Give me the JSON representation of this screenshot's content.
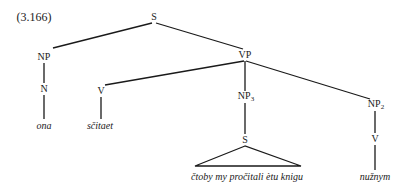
{
  "example_number": "(3.166)",
  "tree": {
    "root": {
      "label": "S",
      "x": 154,
      "y": 17
    },
    "nodes": {
      "np": {
        "label": "NP",
        "x": 44,
        "y": 57
      },
      "n": {
        "label": "N",
        "x": 44,
        "y": 89
      },
      "ona": {
        "label": "ona",
        "x": 44,
        "y": 126
      },
      "vp": {
        "label": "VP",
        "x": 245,
        "y": 55
      },
      "v1": {
        "label": "V",
        "x": 101,
        "y": 91
      },
      "scitaet": {
        "label": "sčitaet",
        "x": 100,
        "y": 126
      },
      "np3": {
        "label": "NP",
        "sub": "3",
        "x": 245,
        "y": 97
      },
      "s2": {
        "label": "S",
        "x": 245,
        "y": 140
      },
      "clause": {
        "label": "čtoby my pročitali ètu knigu",
        "x": 246,
        "y": 177
      },
      "np2": {
        "label": "NP",
        "sub": "2",
        "x": 375,
        "y": 105
      },
      "v2": {
        "label": "V",
        "x": 375,
        "y": 139
      },
      "nuznym": {
        "label": "nužnym",
        "x": 375,
        "y": 177
      }
    }
  },
  "colors": {
    "ink": "#1a1a1a",
    "background": "#ffffff"
  }
}
